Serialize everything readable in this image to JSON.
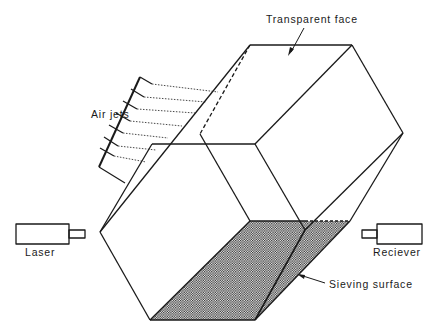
{
  "diagram": {
    "title": "",
    "labels": {
      "transparent_face": "Transparent face",
      "air_jets": "Air jets",
      "laser": "Laser",
      "receiver": "Reciever",
      "sieving_surface": "Sieving surface"
    },
    "components": [
      {
        "id": "hexagonal-drum",
        "description": "Hexagonal prism sieving chamber"
      },
      {
        "id": "air-jets",
        "description": "Row of air jets along upper-left edge",
        "count": 8
      },
      {
        "id": "laser",
        "description": "Laser emitter on left"
      },
      {
        "id": "receiver",
        "description": "Receiver on right"
      },
      {
        "id": "sieving-surface",
        "description": "Stippled mesh bottom face"
      }
    ],
    "colors": {
      "line": "#1a1a1a",
      "background": "#ffffff"
    }
  }
}
